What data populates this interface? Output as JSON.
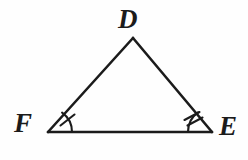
{
  "figure": {
    "kind": "triangle-diagram",
    "name": "triangle-DEF",
    "background_color": "#fefefe",
    "stroke_color": "#1b1b1b",
    "stroke_width": 2.4,
    "labels": {
      "apex": "D",
      "bottom_left": "F",
      "bottom_right": "E"
    },
    "vertices": {
      "D": {
        "x": 133,
        "y": 38
      },
      "F": {
        "x": 48,
        "y": 132
      },
      "E": {
        "x": 212,
        "y": 132
      }
    },
    "sides": [
      {
        "name": "side-FD",
        "from": "F",
        "to": "D"
      },
      {
        "name": "side-DE",
        "from": "D",
        "to": "E"
      },
      {
        "name": "side-FE",
        "from": "F",
        "to": "E"
      }
    ],
    "angle_marks": [
      {
        "name": "angle-mark-F",
        "vertex": "F",
        "ticks": 1
      },
      {
        "name": "angle-mark-E",
        "vertex": "E",
        "ticks": 2
      }
    ]
  }
}
